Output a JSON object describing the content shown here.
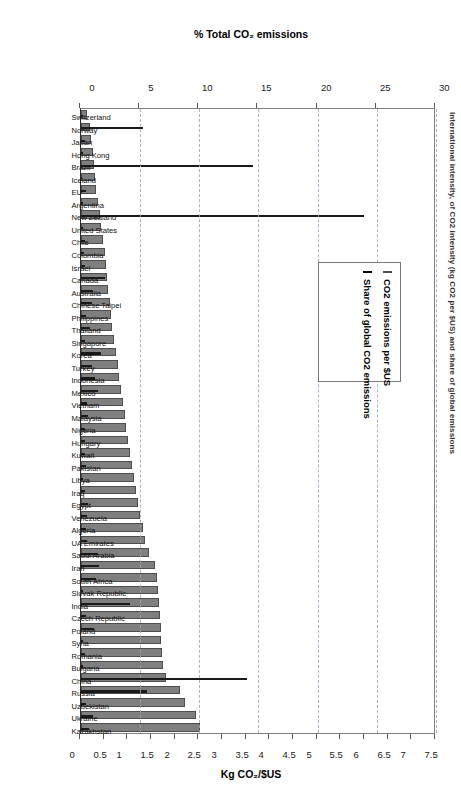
{
  "figure": {
    "title": "International intensity, of CO2 intensity (kg CO2 per $US) and share of global emissions"
  },
  "legend": {
    "position": "inside-upper-left",
    "items": [
      {
        "label": "CO2 emissions per $US",
        "color": "#7f7f7f",
        "marker": "gray-square"
      },
      {
        "label": "Share of global CO2 emissions",
        "color": "#1a1a1a",
        "marker": "black-square"
      }
    ]
  },
  "axes": {
    "left": {
      "title": "% Total CO₂ emissions",
      "ticks": [
        "0",
        "5",
        "10",
        "15",
        "20",
        "25",
        "30"
      ],
      "min": 0,
      "max": 30
    },
    "right": {
      "title": "Kg CO₂/$US",
      "ticks": [
        "0",
        "0.5",
        "1",
        "1.5",
        "2",
        "2.5",
        "3",
        "3.5",
        "4",
        "4.5",
        "5",
        "5.5",
        "6",
        "6.5",
        "7",
        "7.5"
      ],
      "min": 0,
      "max": 7.5
    }
  },
  "chart_data": {
    "type": "bar",
    "title": "International intensity, of CO2 intensity (kg CO2 per $US) and share of global emissions",
    "xlabel": "",
    "ylabel": "% Total CO₂ emissions",
    "y2label": "Kg CO₂/$US",
    "ylim": [
      0,
      30
    ],
    "y2lim": [
      0,
      7.5
    ],
    "grid": true,
    "legend_position": "inside-upper-left",
    "orientation": "vertical-bars-rotated-90",
    "categories": [
      "Switzerland",
      "Norway",
      "Japan",
      "Hong Kong",
      "Brazil",
      "Iceland",
      "EU",
      "Argentina",
      "New Zealand",
      "United States",
      "Chile",
      "Colombia",
      "Israel",
      "Canada",
      "Australia",
      "Chinese Taipei",
      "Philippines",
      "Thailand",
      "Singapore",
      "Korea",
      "Turkey",
      "Indonesia",
      "Mexico",
      "Vietnam",
      "Malaysia",
      "Nigeria",
      "Hungary",
      "Kuwait",
      "Pakistan",
      "Libya",
      "Iraq",
      "Egypt",
      "Venezuela",
      "Algeria",
      "UA Emirates",
      "Saudi Arabia",
      "Iran",
      "South Africa",
      "Slovak Republic",
      "India",
      "Czech Republic",
      "Poland",
      "Syria",
      "Romania",
      "Bulgaria",
      "China",
      "Russia",
      "Uzbekistan",
      "Ukraine",
      "Kazakhstan"
    ],
    "series": [
      {
        "name": "CO2 emissions per $US",
        "unit": "kg CO2/$US",
        "axis": "right",
        "color": "#7f7f7f",
        "values": [
          0.12,
          0.18,
          0.22,
          0.26,
          0.28,
          0.3,
          0.32,
          0.36,
          0.4,
          0.42,
          0.46,
          0.5,
          0.52,
          0.56,
          0.58,
          0.62,
          0.64,
          0.66,
          0.7,
          0.74,
          0.78,
          0.8,
          0.84,
          0.88,
          0.92,
          0.96,
          1.0,
          1.04,
          1.08,
          1.12,
          1.16,
          1.2,
          1.24,
          1.3,
          1.36,
          1.44,
          1.56,
          1.6,
          1.62,
          1.64,
          1.66,
          1.68,
          1.7,
          1.72,
          1.74,
          1.8,
          2.1,
          2.2,
          2.42,
          2.52
        ]
      },
      {
        "name": "Share of global CO2 emissions",
        "unit": "% of total",
        "axis": "left",
        "color": "#1a1a1a",
        "values": [
          0.2,
          5.2,
          0.3,
          0.2,
          14.5,
          0.1,
          0.4,
          0.2,
          23.9,
          0.2,
          0.3,
          0.25,
          0.3,
          2.0,
          1.0,
          0.9,
          0.4,
          0.8,
          0.3,
          1.7,
          0.9,
          1.2,
          1.4,
          0.5,
          0.6,
          0.3,
          0.3,
          0.3,
          0.4,
          0.2,
          0.3,
          0.6,
          0.5,
          0.4,
          0.5,
          1.4,
          1.5,
          1.3,
          0.2,
          4.1,
          0.4,
          1.1,
          0.2,
          0.3,
          0.2,
          14.0,
          5.6,
          0.4,
          1.0,
          0.7
        ]
      }
    ]
  }
}
